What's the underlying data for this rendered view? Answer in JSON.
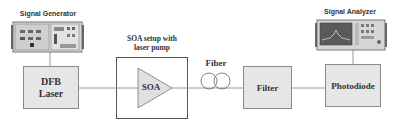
{
  "diagram": {
    "instruments": {
      "signal_generator": {
        "label": "Signal Generator"
      },
      "signal_analyzer": {
        "label": "Signal Analyzer"
      }
    },
    "blocks": {
      "dfb_laser": {
        "line1": "DFB",
        "line2": "Laser"
      },
      "soa_setup": {
        "caption_line1": "SOA setup with",
        "caption_line2": "laser pump",
        "amplifier_label": "SOA"
      },
      "fiber": {
        "label": "Fiber"
      },
      "filter": {
        "label": "Filter"
      },
      "photodiode": {
        "label": "Photodiode"
      }
    },
    "flow": [
      "Signal Generator",
      "DFB Laser",
      "SOA",
      "Fiber",
      "Filter",
      "Photodiode",
      "Signal Analyzer"
    ],
    "colors": {
      "box_fill": "#e6e6e6",
      "box_border": "#8a8a8a",
      "line": "#9a9a9a",
      "text": "#333333"
    }
  }
}
